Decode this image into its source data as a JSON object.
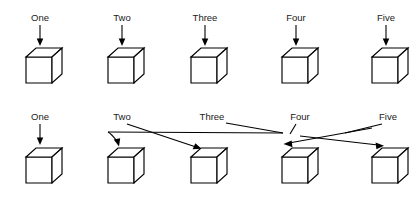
{
  "figure": {
    "background_color": "#ffffff",
    "stroke_color": "#000000",
    "text_color": "#1a1a1a",
    "width": 412,
    "height": 198
  },
  "rows": [
    {
      "name": "top-row-aligned-mapping",
      "labels": [
        "One",
        "Two",
        "Three",
        "Four",
        "Five"
      ],
      "label_y": 18,
      "cube_y": 48,
      "mapping": [
        1,
        2,
        3,
        4,
        5
      ],
      "mapping_style": "straight-vertical-arrows"
    },
    {
      "name": "bottom-row-crossed-mapping",
      "labels": [
        "One",
        "Two",
        "Three",
        "Four",
        "Five"
      ],
      "label_y": 117,
      "cube_y": 148,
      "mapping": [
        1,
        3,
        4,
        2,
        5
      ],
      "mapping_style": "crossed-arrows"
    }
  ],
  "cubes": {
    "count_per_row": 5,
    "x_positions": [
      26,
      108,
      191,
      282,
      372
    ],
    "face_width": 26,
    "face_height": 26,
    "depth_x": 10,
    "depth_y": 9
  },
  "labels_x": [
    40,
    122,
    205,
    296,
    386
  ],
  "top_arrows": [
    {
      "name": "arrow-one",
      "x": 40,
      "y1": 24,
      "y2": 45
    },
    {
      "name": "arrow-two",
      "x": 122,
      "y1": 24,
      "y2": 45
    },
    {
      "name": "arrow-three",
      "x": 205,
      "y1": 24,
      "y2": 45
    },
    {
      "name": "arrow-four",
      "x": 296,
      "y1": 24,
      "y2": 45
    },
    {
      "name": "arrow-five",
      "x": 386,
      "y1": 24,
      "y2": 45
    }
  ],
  "bottom_arrows": [
    {
      "name": "arrow-one-to-cube-one",
      "from_label": "One",
      "to_cube": 1,
      "kind": "straight"
    },
    {
      "name": "arrow-two-to-cube-three",
      "from_label": "Two",
      "to_cube": 3,
      "kind": "diagonal"
    },
    {
      "name": "arrow-three-to-cube-four",
      "from_label": "Three",
      "to_cube": 4,
      "kind": "long-shallow"
    },
    {
      "name": "arrow-four-to-cube-two",
      "from_label": "Four",
      "to_cube": 2,
      "kind": "curved-back"
    },
    {
      "name": "arrow-five-to-cube-five",
      "from_label": "Five",
      "to_cube": 5,
      "kind": "diagonal"
    }
  ]
}
